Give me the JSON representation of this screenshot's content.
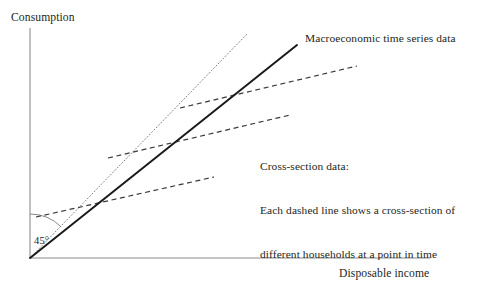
{
  "figure": {
    "domain_note": "economics line diagram",
    "background_color": "#ffffff",
    "ink_color": "#231f20",
    "axis_color": "#8c8c8c",
    "axes": {
      "y_label": "Consumption",
      "x_label": "Disposable income",
      "origin": {
        "x": 30,
        "y": 258
      },
      "y_axis_top": {
        "x": 30,
        "y": 28
      },
      "x_axis_right": {
        "x": 430,
        "y": 258
      }
    },
    "annotations": {
      "macro_label": "Macroeconomic time series data",
      "cross_section_line_1": "Cross-section data:",
      "cross_section_line_2": "Each dashed line shows a cross-section of",
      "cross_section_line_3": "different households at a point in time",
      "angle_label": "45°"
    }
  },
  "chart_data": {
    "type": "line",
    "title": "",
    "xlabel": "Disposable income",
    "ylabel": "Consumption",
    "grid": false,
    "legend": "none",
    "axis_style": "open axes, no tick marks, no numeric scale",
    "xlim": [
      0,
      400
    ],
    "ylim": [
      0,
      230
    ],
    "series": [
      {
        "name": "45-degree line",
        "style": "dotted",
        "color": "#6e6e6e",
        "width": 0.9,
        "points": [
          [
            30,
            258
          ],
          [
            248,
            33
          ]
        ],
        "description": "reference 45 degree ray from the origin"
      },
      {
        "name": "Macroeconomic time series data",
        "style": "solid",
        "color": "#1a1a1a",
        "width": 2.0,
        "points": [
          [
            30,
            258
          ],
          [
            297,
            45
          ]
        ],
        "description": "long-run aggregate consumption function through the origin"
      },
      {
        "name": "Cross-section data (high income period)",
        "style": "dashed",
        "color": "#3a3a3a",
        "width": 1.2,
        "points": [
          [
            180,
            108
          ],
          [
            357,
            66
          ]
        ],
        "description": "upper short-run cross-section consumption function"
      },
      {
        "name": "Cross-section data (middle income period)",
        "style": "dashed",
        "color": "#3a3a3a",
        "width": 1.2,
        "points": [
          [
            108,
            158
          ],
          [
            290,
            115
          ]
        ],
        "description": "middle short-run cross-section consumption function"
      },
      {
        "name": "Cross-section data (low income period)",
        "style": "dashed",
        "color": "#3a3a3a",
        "width": 1.2,
        "points": [
          [
            36,
            217
          ],
          [
            214,
            177
          ]
        ],
        "description": "lower short-run cross-section consumption function"
      }
    ],
    "angle_arc": {
      "label": "45°",
      "center": [
        30,
        258
      ],
      "radius": 44,
      "from_axis": "vertical",
      "to_series": "45-degree line"
    }
  }
}
